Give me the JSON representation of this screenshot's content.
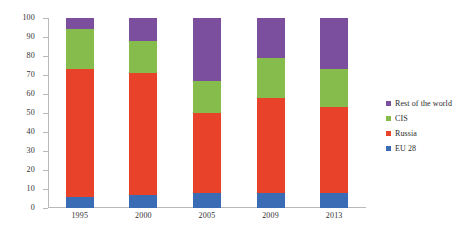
{
  "chart_data": {
    "type": "bar",
    "stacked": true,
    "title": "",
    "xlabel": "",
    "ylabel": "",
    "categories": [
      "1995",
      "2000",
      "2005",
      "2009",
      "2013"
    ],
    "ylim": [
      0,
      100
    ],
    "yticks": [
      0,
      10,
      20,
      30,
      40,
      50,
      60,
      70,
      80,
      90,
      100
    ],
    "ytick_labels": [
      "0",
      "10",
      "20",
      "30",
      "40",
      "50",
      "60",
      "70",
      "80",
      "90",
      "100"
    ],
    "grid": false,
    "legend_position": "right",
    "series": [
      {
        "name": "EU 28",
        "color": "#3A6BB5",
        "values": [
          6,
          7,
          8,
          8,
          8
        ]
      },
      {
        "name": "Russia",
        "color": "#E8432A",
        "values": [
          67,
          64,
          42,
          50,
          45
        ]
      },
      {
        "name": "CIS",
        "color": "#86BC4B",
        "values": [
          21,
          17,
          17,
          21,
          20
        ]
      },
      {
        "name": "Rest of the world",
        "color": "#7B4E9E",
        "values": [
          6,
          12,
          33,
          21,
          27
        ]
      }
    ],
    "stack_tops": {
      "EU 28": [
        6,
        7,
        8,
        8,
        8
      ],
      "Russia": [
        73,
        71,
        50,
        58,
        53
      ],
      "CIS": [
        94,
        88,
        67,
        79,
        73
      ],
      "Rest of the world": [
        100,
        100,
        100,
        100,
        100
      ]
    }
  },
  "legend": {
    "items": [
      {
        "label": "Rest of the world",
        "color": "#7B4E9E",
        "swatch_name": "legend-swatch-rest-of-the-world"
      },
      {
        "label": "CIS",
        "color": "#86BC4B",
        "swatch_name": "legend-swatch-cis"
      },
      {
        "label": "Russia",
        "color": "#E8432A",
        "swatch_name": "legend-swatch-russia"
      },
      {
        "label": "EU 28",
        "color": "#3A6BB5",
        "swatch_name": "legend-swatch-eu-28"
      }
    ]
  },
  "colors": {
    "axis": "#b9b9b9",
    "text": "#2b2b2b",
    "background": "#ffffff"
  }
}
